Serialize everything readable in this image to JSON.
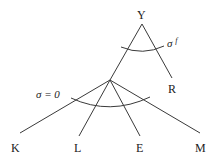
{
  "diagram": {
    "type": "tree",
    "nodes": {
      "root": {
        "label": "Y"
      },
      "right_leaf": {
        "label": "R"
      },
      "leaves": [
        {
          "label": "K"
        },
        {
          "label": "L"
        },
        {
          "label": "E"
        },
        {
          "label": "M"
        }
      ]
    },
    "annotations": {
      "upper_arc": {
        "symbol": "σ",
        "superscript": "f"
      },
      "lower_arc": {
        "text": "σ = 0"
      }
    }
  }
}
